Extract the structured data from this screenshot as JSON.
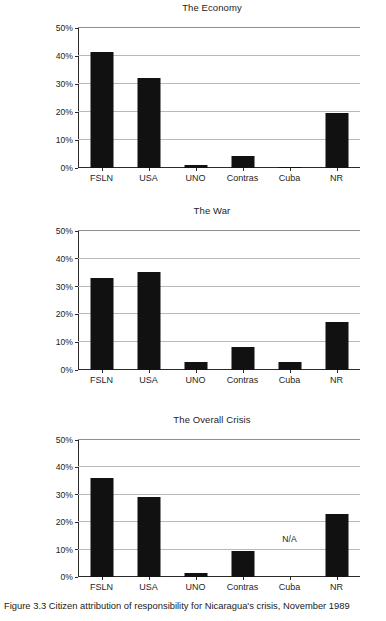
{
  "caption": {
    "number": "Figure 3.3",
    "text": "Citizen attribution of responsibility for Nicaragua's crisis, November 1989"
  },
  "axis": {
    "ytick_labels": [
      "0%",
      "10%",
      "20%",
      "30%",
      "40%",
      "50%"
    ],
    "ytick_values": [
      0,
      10,
      20,
      30,
      40,
      50
    ],
    "categories": [
      "FSLN",
      "USA",
      "UNO",
      "Contras",
      "Cuba",
      "NR"
    ],
    "na_label": "N/A"
  },
  "colors": {
    "bar": "#111111",
    "gridline": "#b9b9b9",
    "axis": "#2b2b2b",
    "background": "#ffffff",
    "text": "#1c1c1c"
  },
  "chart_data": [
    {
      "type": "bar",
      "title": "The Economy",
      "categories": [
        "FSLN",
        "USA",
        "UNO",
        "Contras",
        "Cuba",
        "NR"
      ],
      "values": [
        41.5,
        32.3,
        1.2,
        4.2,
        0.5,
        19.6
      ],
      "xlabel": "",
      "ylabel": "",
      "ylim": [
        0,
        50
      ],
      "ytick_labels": [
        "0%",
        "10%",
        "20%",
        "30%",
        "40%",
        "50%"
      ],
      "grid": true,
      "legend": "none"
    },
    {
      "type": "bar",
      "title": "The War",
      "categories": [
        "FSLN",
        "USA",
        "UNO",
        "Contras",
        "Cuba",
        "NR"
      ],
      "values": [
        33.0,
        35.3,
        2.8,
        8.3,
        2.8,
        17.1
      ],
      "xlabel": "",
      "ylabel": "",
      "ylim": [
        0,
        50
      ],
      "ytick_labels": [
        "0%",
        "10%",
        "20%",
        "30%",
        "40%",
        "50%"
      ],
      "grid": true,
      "legend": "none"
    },
    {
      "type": "bar",
      "title": "The Overall Crisis",
      "categories": [
        "FSLN",
        "USA",
        "UNO",
        "Contras",
        "Cuba",
        "NR"
      ],
      "values": [
        36.0,
        29.2,
        1.3,
        9.5,
        null,
        23.1
      ],
      "annotations": [
        {
          "category": "Cuba",
          "text": "N/A",
          "y": 12
        }
      ],
      "xlabel": "",
      "ylabel": "",
      "ylim": [
        0,
        50
      ],
      "ytick_labels": [
        "0%",
        "10%",
        "20%",
        "30%",
        "40%",
        "50%"
      ],
      "grid": true,
      "legend": "none"
    }
  ]
}
